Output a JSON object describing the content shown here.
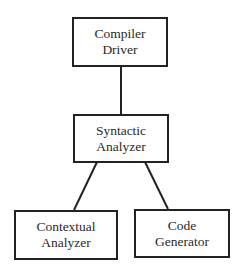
{
  "diagram": {
    "type": "tree",
    "nodes": [
      {
        "id": "compiler-driver",
        "line1": "Compiler",
        "line2": "Driver"
      },
      {
        "id": "syntactic-analyzer",
        "line1": "Syntactic",
        "line2": "Analyzer"
      },
      {
        "id": "contextual-analyzer",
        "line1": "Contextual",
        "line2": "Analyzer"
      },
      {
        "id": "code-generator",
        "line1": "Code",
        "line2": "Generator"
      }
    ],
    "edges": [
      {
        "from": "compiler-driver",
        "to": "syntactic-analyzer"
      },
      {
        "from": "syntactic-analyzer",
        "to": "contextual-analyzer"
      },
      {
        "from": "syntactic-analyzer",
        "to": "code-generator"
      }
    ],
    "colors": {
      "stroke": "#222222",
      "text": "#2a2a2a",
      "background": "#ffffff"
    }
  }
}
